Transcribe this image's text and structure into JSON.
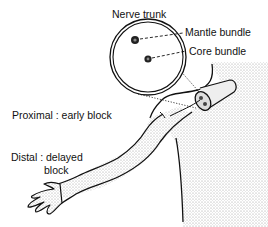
{
  "diagram": {
    "labels": {
      "nerve_trunk": "Nerve trunk",
      "mantle_bundle": "Mantle bundle",
      "core_bundle": "Core bundle",
      "proximal": "Proximal : early block",
      "distal_line1": "Distal : delayed",
      "distal_line2": "block"
    },
    "colors": {
      "line": "#111111",
      "shading": "#d9d9d9",
      "background": "#ffffff"
    }
  }
}
